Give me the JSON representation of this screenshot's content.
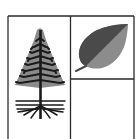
{
  "logo": {
    "description": "Emblem with a conifer tree with roots and a leaf in a divided box",
    "icons": {
      "tree": "conifer-tree-with-roots-icon",
      "leaf": "leaf-icon"
    },
    "colors": {
      "background": "#ffffff",
      "frame": "#2a2a2a",
      "tree_fill": "#8a8a8a",
      "tree_branches": "#1a1a1a",
      "leaf_dark": "#4a4a4a",
      "leaf_light": "#8c8c8c"
    }
  }
}
